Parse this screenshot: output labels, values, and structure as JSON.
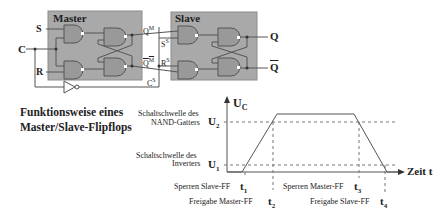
{
  "circuit": {
    "master_label": "Master",
    "slave_label": "Slave",
    "inputs": {
      "S": "S",
      "C": "C",
      "R": "R"
    },
    "outputs": {
      "Q": "Q",
      "Qbar": "Q"
    },
    "internal": {
      "QM": "Q",
      "QM_sup": "M",
      "QMbar": "Q",
      "QMbar_sup": "M",
      "SS": "S",
      "SS_sup": "S",
      "RS": "R",
      "RS_sup": "S",
      "CS": "C",
      "CS_sup": "S"
    },
    "colors": {
      "box_fill": "#a8a8a8",
      "box_border": "#8a8a8a",
      "line": "#555555"
    }
  },
  "title": {
    "line1": "Funktionsweise eines",
    "line2": "Master/Slave-Flipflops"
  },
  "graph": {
    "y_axis_label": "U",
    "y_axis_sub": "C",
    "x_axis_label": "Zeit t",
    "u2": {
      "desc1": "Schaltschwelle des",
      "desc2": "NAND-Gatters",
      "sym": "U",
      "sub": "2"
    },
    "u1": {
      "desc1": "Schaltschwelle des",
      "desc2": "Inverters",
      "sym": "U",
      "sub": "1"
    },
    "events": [
      {
        "label": "Sperren Slave-FF",
        "t": "t",
        "sub": "1"
      },
      {
        "label": "Freigabe Master-FF",
        "t": "t",
        "sub": "2"
      },
      {
        "label": "Sperren Master-FF",
        "t": "t",
        "sub": "3"
      },
      {
        "label": "Freigabe Slave-FF",
        "t": "t",
        "sub": "4"
      }
    ]
  }
}
